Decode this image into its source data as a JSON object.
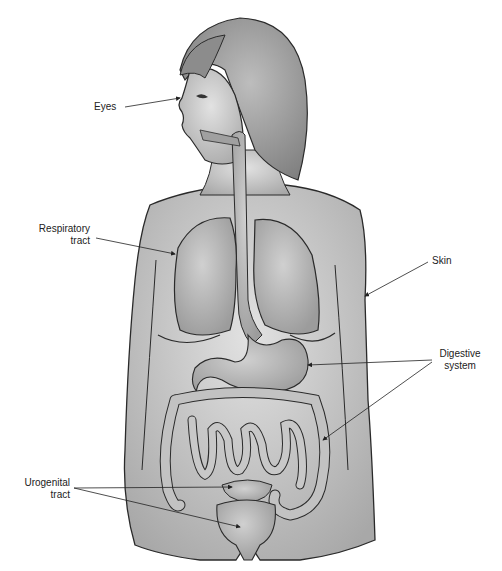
{
  "figure": {
    "type": "anatomical-diagram"
  },
  "labels": {
    "eyes": "Eyes",
    "respiratory_line1": "Respiratory",
    "respiratory_line2": "tract",
    "skin": "Skin",
    "digestive_line1": "Digestive",
    "digestive_line2": "system",
    "urogenital_line1": "Urogenital",
    "urogenital_line2": "tract"
  },
  "colors": {
    "skin_fill": "#c8c8c8",
    "organ_fill": "#b4b4b4",
    "outline": "#2a2a2a",
    "hair_fill": "#9a9a9a",
    "label_text": "#222222"
  }
}
